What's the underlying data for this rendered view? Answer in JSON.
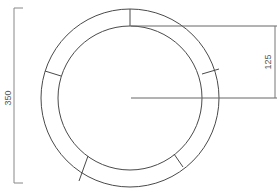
{
  "diagram": {
    "type": "segmented-ring",
    "outer_diameter_label": "350",
    "radius_label": "125",
    "segments": 6,
    "line_color": "#4a4a4a",
    "dimension_color": "#777777"
  }
}
